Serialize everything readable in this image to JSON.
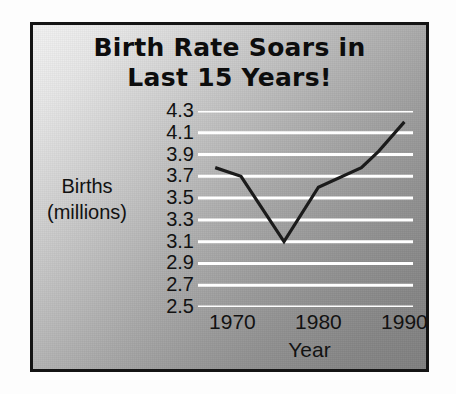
{
  "chart_data": {
    "type": "line",
    "title": "Birth Rate Soars in Last 15 Years!",
    "title_lines": [
      "Birth Rate Soars in",
      "Last 15 Years!"
    ],
    "xlabel": "Year",
    "ylabel": "Births (millions)",
    "ylabel_lines": [
      "Births",
      "(millions)"
    ],
    "xlim": [
      1966,
      1991
    ],
    "ylim": [
      2.5,
      4.3
    ],
    "grid": "horizontal",
    "legend": "none",
    "y_ticks": [
      "4.3",
      "4.1",
      "3.9",
      "3.7",
      "3.5",
      "3.3",
      "3.1",
      "2.9",
      "2.7",
      "2.5"
    ],
    "y_tick_values": [
      4.3,
      4.1,
      3.9,
      3.7,
      3.5,
      3.3,
      3.1,
      2.9,
      2.7,
      2.5
    ],
    "x_ticks": [
      "1970",
      "1980",
      "1990"
    ],
    "x_tick_values": [
      1970,
      1980,
      1990
    ],
    "x": [
      1968,
      1971,
      1976,
      1980,
      1985,
      1987,
      1990
    ],
    "values": [
      3.78,
      3.7,
      3.1,
      3.6,
      3.78,
      3.93,
      4.2
    ],
    "series": [
      {
        "name": "Births",
        "x": [
          1968,
          1971,
          1976,
          1980,
          1985,
          1987,
          1990
        ],
        "values": [
          3.78,
          3.7,
          3.1,
          3.6,
          3.78,
          3.93,
          4.2
        ]
      }
    ],
    "colors": {
      "line": "#1b1b1b",
      "gridline": "#ffffff",
      "text": "#121212",
      "title": "#0d0d0d",
      "frame": "#141414",
      "plot_bg_light": "#f2f2f2",
      "plot_bg_dark": "#808080"
    }
  }
}
